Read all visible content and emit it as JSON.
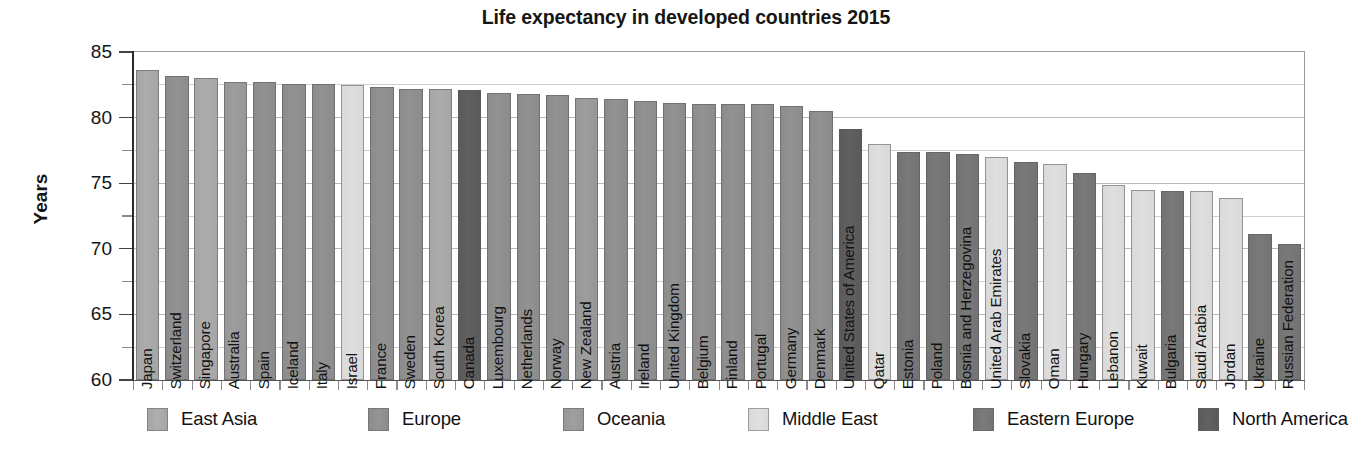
{
  "chart_data": {
    "type": "bar",
    "title": "Life expectancy in developed countries 2015",
    "xlabel": "",
    "ylabel": "Years",
    "ylim": [
      60,
      85
    ],
    "ytick_labels": [
      "85",
      "80",
      "75",
      "70",
      "65",
      "60"
    ],
    "ytick_values": [
      85,
      80,
      75,
      70,
      65,
      60
    ],
    "yminor_values": [
      82.5,
      77.5,
      72.5,
      67.5,
      62.5
    ],
    "grid": true,
    "legend_position": "bottom",
    "categories": [
      "Japan",
      "Switzerland",
      "Singapore",
      "Australia",
      "Spain",
      "Iceland",
      "Italy",
      "Israel",
      "France",
      "Sweden",
      "South Korea",
      "Canada",
      "Luxembourg",
      "Netherlands",
      "Norway",
      "New Zealand",
      "Austria",
      "Ireland",
      "United Kingdom",
      "Belgium",
      "Finland",
      "Portugal",
      "Germany",
      "Denmark",
      "United States of America",
      "Qatar",
      "Estonia",
      "Poland",
      "Bosnia and Herzegovina",
      "United Arab Emirates",
      "Slovakia",
      "Oman",
      "Hungary",
      "Lebanon",
      "Kuwait",
      "Bulgaria",
      "Saudi Arabia",
      "Jordan",
      "Ukraine",
      "Russian Federation"
    ],
    "values": [
      83.6,
      83.2,
      83.0,
      82.7,
      82.7,
      82.6,
      82.6,
      82.5,
      82.3,
      82.2,
      82.2,
      82.1,
      81.9,
      81.8,
      81.7,
      81.5,
      81.4,
      81.3,
      81.1,
      81.0,
      81.0,
      81.0,
      80.9,
      80.5,
      79.1,
      78.0,
      77.4,
      77.4,
      77.2,
      77.0,
      76.6,
      76.5,
      75.8,
      74.9,
      74.5,
      74.4,
      74.4,
      73.9,
      71.1,
      70.4
    ],
    "regions": [
      "East Asia",
      "Europe",
      "East Asia",
      "Oceania",
      "Europe",
      "Europe",
      "Europe",
      "Middle East",
      "Europe",
      "Europe",
      "East Asia",
      "North America",
      "Europe",
      "Europe",
      "Europe",
      "Oceania",
      "Europe",
      "Europe",
      "Europe",
      "Europe",
      "Europe",
      "Europe",
      "Europe",
      "Europe",
      "North America",
      "Middle East",
      "Eastern Europe",
      "Eastern Europe",
      "Eastern Europe",
      "Middle East",
      "Eastern Europe",
      "Middle East",
      "Eastern Europe",
      "Middle East",
      "Middle East",
      "Eastern Europe",
      "Middle East",
      "Middle East",
      "Eastern Europe",
      "Eastern Europe"
    ]
  },
  "legend": {
    "items": [
      {
        "label": "East Asia",
        "color": "#a6a6a6"
      },
      {
        "label": "Europe",
        "color": "#8c8c8c"
      },
      {
        "label": "Oceania",
        "color": "#979797"
      },
      {
        "label": "Middle East",
        "color": "#d9d9d9"
      },
      {
        "label": "Eastern Europe",
        "color": "#737373"
      },
      {
        "label": "North America",
        "color": "#5a5a5a"
      }
    ]
  },
  "colors": {
    "east_asia": "#a6a6a6",
    "europe": "#8c8c8c",
    "oceania": "#979797",
    "middle_east": "#d9d9d9",
    "eastern_europe": "#737373",
    "north_america": "#5a5a5a",
    "gridline": "#b9b9b9",
    "axis": "#2a2a2a",
    "text": "#141414"
  }
}
